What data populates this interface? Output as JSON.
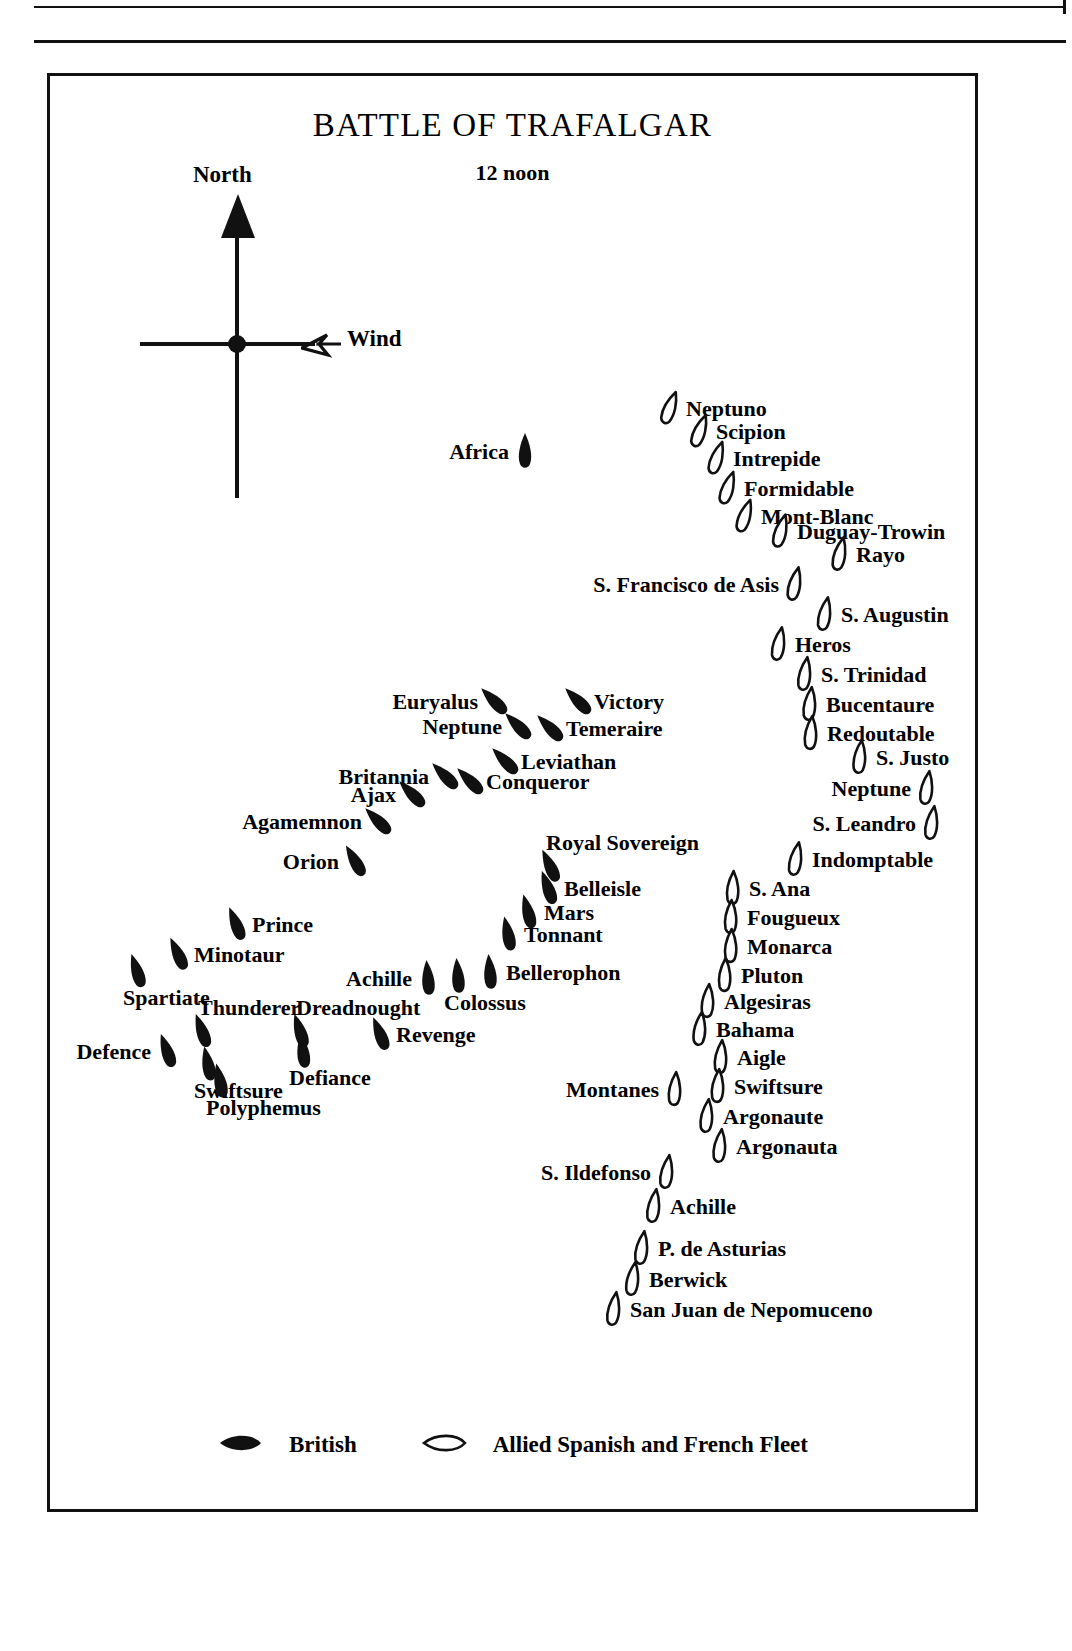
{
  "plate": {
    "title": "BATTLE OF TRAFALGAR",
    "subtitle": "12 noon"
  },
  "compass": {
    "north_label": "North",
    "wind_label": "Wind",
    "north_icon": "solid-arrow-up-icon",
    "wind_icon": "outline-arrow-right-icon"
  },
  "legend": {
    "british_label": "British",
    "allied_label": "Allied Spanish and French Fleet",
    "british_icon": "filled-ship-icon",
    "allied_icon": "outline-ship-icon"
  },
  "colors": {
    "ink": "#111111",
    "paper": "#ffffff"
  },
  "chart_data": {
    "type": "scatter",
    "title": "BATTLE OF TRAFALGAR",
    "subtitle": "12 noon",
    "xlabel": "",
    "ylabel": "",
    "legend_position": "bottom-center",
    "series": [
      {
        "name": "British",
        "marker": "filled-ship",
        "points": [
          {
            "label": "Africa",
            "x": 475,
            "y": 375,
            "rot": 0,
            "side": "left"
          },
          {
            "label": "Victory",
            "x": 528,
            "y": 625,
            "rot": -45,
            "side": "right"
          },
          {
            "label": "Temeraire",
            "x": 500,
            "y": 652,
            "rot": -45,
            "side": "right"
          },
          {
            "label": "Neptune",
            "x": 468,
            "y": 650,
            "rot": -45,
            "side": "left"
          },
          {
            "label": "Euryalus",
            "x": 444,
            "y": 625,
            "rot": -45,
            "side": "left"
          },
          {
            "label": "Leviathan",
            "x": 455,
            "y": 685,
            "rot": -45,
            "side": "right"
          },
          {
            "label": "Conqueror",
            "x": 420,
            "y": 705,
            "rot": -45,
            "side": "right"
          },
          {
            "label": "Britannia",
            "x": 395,
            "y": 700,
            "rot": -45,
            "side": "left"
          },
          {
            "label": "Ajax",
            "x": 362,
            "y": 718,
            "rot": -45,
            "side": "left"
          },
          {
            "label": "Agamemnon",
            "x": 328,
            "y": 745,
            "rot": -45,
            "side": "left"
          },
          {
            "label": "Orion",
            "x": 305,
            "y": 785,
            "rot": -30,
            "side": "left"
          },
          {
            "label": "Royal Sovereign",
            "x": 500,
            "y": 790,
            "rot": -25,
            "side": "above"
          },
          {
            "label": "Belleisle",
            "x": 498,
            "y": 812,
            "rot": -20,
            "side": "right"
          },
          {
            "label": "Mars",
            "x": 478,
            "y": 836,
            "rot": -15,
            "side": "right"
          },
          {
            "label": "Tonnant",
            "x": 458,
            "y": 858,
            "rot": -12,
            "side": "right"
          },
          {
            "label": "Prince",
            "x": 186,
            "y": 848,
            "rot": -22,
            "side": "right"
          },
          {
            "label": "Minotaur",
            "x": 128,
            "y": 878,
            "rot": -25,
            "side": "right"
          },
          {
            "label": "Spartiate",
            "x": 87,
            "y": 895,
            "rot": -18,
            "side": "below"
          },
          {
            "label": "Bellerophon",
            "x": 440,
            "y": 896,
            "rot": -5,
            "side": "right"
          },
          {
            "label": "Colossus",
            "x": 408,
            "y": 900,
            "rot": -5,
            "side": "below"
          },
          {
            "label": "Achille",
            "x": 378,
            "y": 902,
            "rot": -5,
            "side": "left"
          },
          {
            "label": "Revenge",
            "x": 330,
            "y": 958,
            "rot": -22,
            "side": "right"
          },
          {
            "label": "Dreadnought",
            "x": 250,
            "y": 955,
            "rot": -18,
            "side": "above"
          },
          {
            "label": "Defiance",
            "x": 253,
            "y": 975,
            "rot": -8,
            "side": "below"
          },
          {
            "label": "Thunderer",
            "x": 152,
            "y": 955,
            "rot": -20,
            "side": "above"
          },
          {
            "label": "Defence",
            "x": 117,
            "y": 975,
            "rot": -20,
            "side": "left"
          },
          {
            "label": "Swiftsure",
            "x": 158,
            "y": 988,
            "rot": -12,
            "side": "below"
          },
          {
            "label": "Polyphemus",
            "x": 170,
            "y": 1005,
            "rot": -12,
            "side": "below"
          }
        ]
      },
      {
        "name": "Allied Spanish and French Fleet",
        "marker": "outline-ship",
        "points": [
          {
            "label": "Neptuno",
            "x": 620,
            "y": 332,
            "rot": 20,
            "side": "right"
          },
          {
            "label": "Scipion",
            "x": 650,
            "y": 355,
            "rot": 20,
            "side": "right"
          },
          {
            "label": "Intrepide",
            "x": 667,
            "y": 382,
            "rot": 18,
            "side": "right"
          },
          {
            "label": "Formidable",
            "x": 678,
            "y": 412,
            "rot": 18,
            "side": "right"
          },
          {
            "label": "Mont-Blanc",
            "x": 695,
            "y": 440,
            "rot": 18,
            "side": "right"
          },
          {
            "label": "Duguay-Trowin",
            "x": 731,
            "y": 455,
            "rot": 15,
            "side": "right"
          },
          {
            "label": "Rayo",
            "x": 790,
            "y": 478,
            "rot": 12,
            "side": "right"
          },
          {
            "label": "S. Francisco de Asis",
            "x": 745,
            "y": 508,
            "rot": 12,
            "side": "left"
          },
          {
            "label": "S. Augustin",
            "x": 775,
            "y": 538,
            "rot": 10,
            "side": "right"
          },
          {
            "label": "Heros",
            "x": 729,
            "y": 568,
            "rot": 10,
            "side": "right"
          },
          {
            "label": "S. Trinidad",
            "x": 755,
            "y": 598,
            "rot": 8,
            "side": "right"
          },
          {
            "label": "Bucentaure",
            "x": 760,
            "y": 628,
            "rot": 6,
            "side": "right"
          },
          {
            "label": "Redoutable",
            "x": 761,
            "y": 657,
            "rot": 4,
            "side": "right"
          },
          {
            "label": "S. Justo",
            "x": 810,
            "y": 681,
            "rot": 6,
            "side": "right"
          },
          {
            "label": "Neptune",
            "x": 877,
            "y": 712,
            "rot": 8,
            "side": "left"
          },
          {
            "label": "S. Leandro",
            "x": 882,
            "y": 747,
            "rot": 8,
            "side": "left"
          },
          {
            "label": "Indomptable",
            "x": 746,
            "y": 783,
            "rot": 10,
            "side": "right"
          },
          {
            "label": "S. Ana",
            "x": 683,
            "y": 812,
            "rot": 2,
            "side": "right"
          },
          {
            "label": "Fougueux",
            "x": 681,
            "y": 841,
            "rot": 2,
            "side": "right"
          },
          {
            "label": "Monarca",
            "x": 681,
            "y": 870,
            "rot": 2,
            "side": "right"
          },
          {
            "label": "Pluton",
            "x": 675,
            "y": 899,
            "rot": 2,
            "side": "right"
          },
          {
            "label": "Algesiras",
            "x": 658,
            "y": 925,
            "rot": 4,
            "side": "right"
          },
          {
            "label": "Bahama",
            "x": 650,
            "y": 953,
            "rot": 6,
            "side": "right"
          },
          {
            "label": "Aigle",
            "x": 671,
            "y": 981,
            "rot": 4,
            "side": "right"
          },
          {
            "label": "Swiftsure",
            "x": 668,
            "y": 1010,
            "rot": 4,
            "side": "right"
          },
          {
            "label": "Montanes",
            "x": 625,
            "y": 1013,
            "rot": 4,
            "side": "left"
          },
          {
            "label": "Argonaute",
            "x": 657,
            "y": 1040,
            "rot": 6,
            "side": "right"
          },
          {
            "label": "Argonauta",
            "x": 670,
            "y": 1070,
            "rot": 6,
            "side": "right"
          },
          {
            "label": "S. Ildefonso",
            "x": 617,
            "y": 1096,
            "rot": 8,
            "side": "left"
          },
          {
            "label": "Achille",
            "x": 604,
            "y": 1130,
            "rot": 8,
            "side": "right"
          },
          {
            "label": "P. de Asturias",
            "x": 592,
            "y": 1172,
            "rot": 8,
            "side": "right"
          },
          {
            "label": "Berwick",
            "x": 583,
            "y": 1203,
            "rot": 8,
            "side": "right"
          },
          {
            "label": "San Juan de Nepomuceno",
            "x": 564,
            "y": 1233,
            "rot": 8,
            "side": "right"
          }
        ]
      }
    ]
  }
}
